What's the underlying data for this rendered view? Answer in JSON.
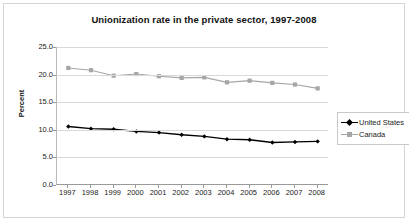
{
  "chart_data": {
    "type": "line",
    "title": "Unionization rate in the private sector, 1997-2008",
    "xlabel": "",
    "ylabel": "Percent",
    "categories": [
      "1997",
      "1998",
      "1999",
      "2000",
      "2001",
      "2002",
      "2003",
      "2004",
      "2005",
      "2006",
      "2007",
      "2008"
    ],
    "series": [
      {
        "name": "United States",
        "color": "#000000",
        "marker": "diamond",
        "values": [
          10.6,
          10.2,
          10.1,
          9.7,
          9.5,
          9.1,
          8.8,
          8.3,
          8.2,
          7.7,
          7.8,
          7.9
        ]
      },
      {
        "name": "Canada",
        "color": "#a6a6a6",
        "marker": "square",
        "values": [
          21.2,
          20.8,
          19.8,
          20.1,
          19.7,
          19.4,
          19.5,
          18.6,
          18.9,
          18.5,
          18.2,
          17.5
        ]
      }
    ],
    "ylim": [
      0,
      25
    ],
    "yticks": [
      "0.0",
      "5.0",
      "10.0",
      "15.0",
      "20.0",
      "25.0"
    ],
    "ytick_values": [
      0,
      5,
      10,
      15,
      20,
      25
    ],
    "grid": true,
    "legend_position": "right"
  },
  "legend": {
    "items": [
      {
        "label": "United States"
      },
      {
        "label": "Canada"
      }
    ]
  },
  "colors": {
    "united_states": "#000000",
    "canada": "#a6a6a6",
    "gridline": "#d9d9d9",
    "axis": "#9a9a9a",
    "frame": "#d4d4d4"
  }
}
